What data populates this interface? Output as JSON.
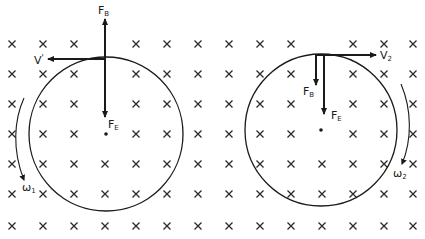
{
  "diagram": {
    "field": {
      "symbol": "×",
      "meaning": "magnetic field into page",
      "rows_y": [
        44,
        74,
        104,
        134,
        164,
        194,
        226
      ],
      "cols_x": [
        12,
        43,
        74,
        105,
        136,
        167,
        198,
        229,
        260,
        291,
        322,
        353,
        384,
        413
      ]
    },
    "left": {
      "circle": {
        "cx": 106,
        "cy": 134,
        "r": 77
      },
      "labels": {
        "force_up": {
          "main": "F",
          "sub": "B"
        },
        "velocity": {
          "main": "V",
          "sup": "'"
        },
        "force_down": {
          "main": "F",
          "sub": "E"
        },
        "omega": {
          "main": "ω",
          "sub": "1"
        }
      }
    },
    "right": {
      "circle": {
        "cx": 321,
        "cy": 130,
        "r": 76
      },
      "labels": {
        "velocity": {
          "main": "V",
          "sub": "2"
        },
        "force_b": {
          "main": "F",
          "sub": "B"
        },
        "force_e": {
          "main": "F",
          "sub": "E"
        },
        "omega": {
          "main": "ω",
          "sub": "2"
        }
      }
    },
    "colors": {
      "ink": "#1a1a1a",
      "background": "#ffffff"
    }
  }
}
